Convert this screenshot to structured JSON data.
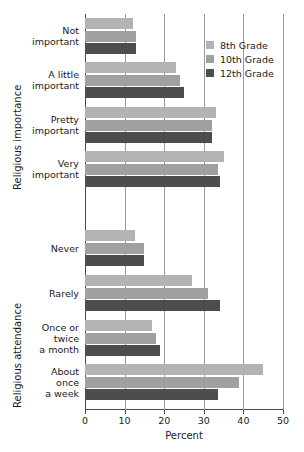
{
  "chart_data": {
    "type": "bar",
    "orientation": "horizontal",
    "title": "",
    "xlabel": "Percent",
    "ylabel": "",
    "xlim": [
      0,
      50
    ],
    "xticks": [
      0,
      10,
      20,
      30,
      40,
      50
    ],
    "xtick_labels": [
      "0",
      "10",
      "20",
      "30",
      "40",
      "50"
    ],
    "grid": true,
    "grid_axis": "x",
    "legend_position": "top-right",
    "sections": [
      {
        "title": "Religious importance",
        "categories": [
          "Not important",
          "A little important",
          "Pretty important",
          "Very important"
        ]
      },
      {
        "title": "Religious attendance",
        "categories": [
          "Never",
          "Rarely",
          "Once or twice a month",
          "About once a week"
        ]
      }
    ],
    "categories": [
      "Not important",
      "A little important",
      "Pretty important",
      "Very important",
      "Never",
      "Rarely",
      "Once or twice a month",
      "About once a week"
    ],
    "category_lines": [
      [
        "Not",
        "important"
      ],
      [
        "A little",
        "important"
      ],
      [
        "Pretty",
        "important"
      ],
      [
        "Very",
        "important"
      ],
      [
        "Never"
      ],
      [
        "Rarely"
      ],
      [
        "Once or",
        "twice",
        "a month"
      ],
      [
        "About",
        "once",
        "a week"
      ]
    ],
    "series": [
      {
        "name": "8th Grade",
        "color": "#b3b3b3",
        "values": [
          12,
          23,
          33,
          35,
          12.5,
          27,
          17,
          45
        ]
      },
      {
        "name": "10th Grade",
        "color": "#a0a0a0",
        "values": [
          13,
          24,
          32,
          33.5,
          15,
          31,
          18,
          39
        ]
      },
      {
        "name": "12th Grade",
        "color": "#4d4d4d",
        "values": [
          13,
          25,
          32,
          34,
          15,
          34,
          19,
          33.5
        ]
      }
    ]
  },
  "legend": {
    "items": [
      {
        "label": "8th Grade",
        "color": "#b3b3b3"
      },
      {
        "label": "10th Grade",
        "color": "#a0a0a0"
      },
      {
        "label": "12th Grade",
        "color": "#4d4d4d"
      }
    ]
  },
  "axis": {
    "x_title": "Percent"
  },
  "section_titles": {
    "importance": "Religious importance",
    "attendance": "Religious attendance"
  }
}
